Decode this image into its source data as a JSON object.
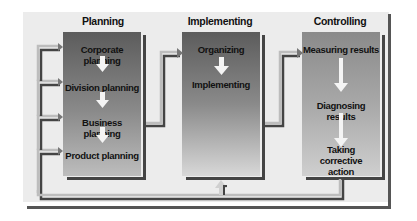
{
  "diagram": {
    "columns": [
      {
        "title": "Planning",
        "steps": [
          "Corporate planning",
          "Division planning",
          "Business planning",
          "Product planning"
        ]
      },
      {
        "title": "Implementing",
        "steps": [
          "Organizing",
          "Implementing"
        ]
      },
      {
        "title": "Controlling",
        "steps": [
          "Measuring results",
          "Diagnosing results",
          "Taking corrective action"
        ]
      }
    ],
    "colors": {
      "background": "#ececec",
      "box_dark": "#5a5a5a",
      "box_light": "#c8c8c8",
      "arrow_light": "#f4f4f4",
      "line_dark": "#444444",
      "line_light": "#bdbdbd"
    }
  }
}
